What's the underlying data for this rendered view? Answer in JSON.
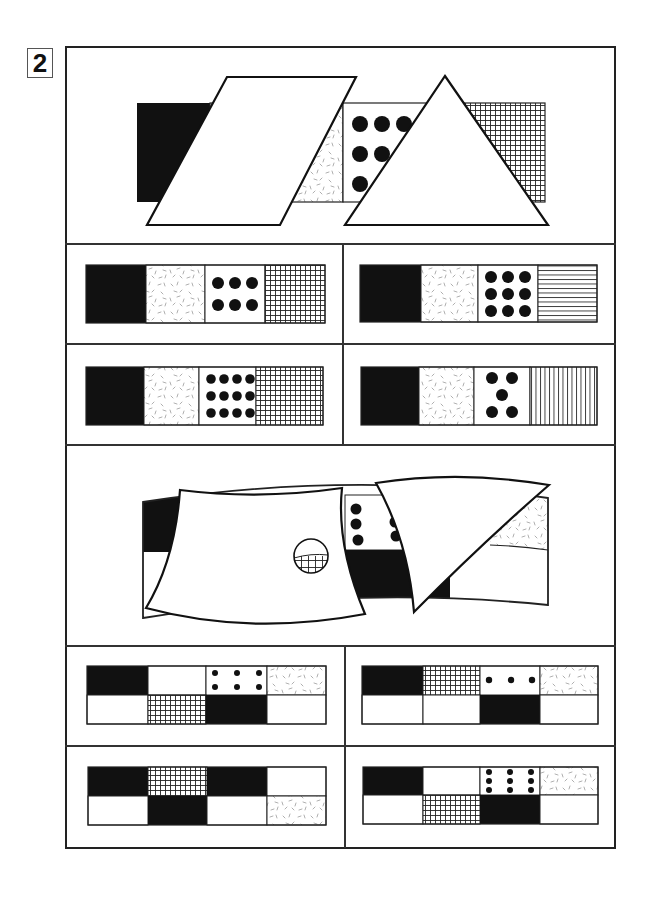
{
  "puzzle": {
    "number": "2",
    "colors": {
      "ink": "#111111",
      "line": "#222222",
      "paper": "#ffffff",
      "speckle": "#9a9a9a"
    },
    "problems": [
      {
        "id": "problem-1",
        "question": {
          "description": "Strip of four patterned squares (black, speckled, six large dots, fine grid) partly hidden behind a white parallelogram and a white triangle",
          "visible_segments": [
            "solid-black",
            "speckled",
            "large-dots-grid",
            "fine-grid"
          ],
          "occluders": [
            "parallelogram",
            "triangle"
          ]
        },
        "options": [
          {
            "position": "top-left",
            "cells": [
              "solid-black",
              "speckled",
              "dots-2x3 (6 large)",
              "fine-grid"
            ]
          },
          {
            "position": "top-right",
            "cells": [
              "solid-black",
              "speckled",
              "dots-3x3 (9 large)",
              "horizontal-lines"
            ]
          },
          {
            "position": "bottom-left",
            "cells": [
              "solid-black",
              "speckled",
              "dots-3x4 (12 large)",
              "fine-grid"
            ]
          },
          {
            "position": "bottom-right",
            "cells": [
              "solid-black",
              "speckled",
              "dots-five-dice (5 large)",
              "vertical-lines"
            ]
          }
        ]
      },
      {
        "id": "problem-2",
        "question": {
          "description": "Curved two-row band of patterned rectangles partly hidden behind a curved white panel (with a circular window showing grid) and a curved triangle",
          "visible_segments": [
            "solid-black",
            "white",
            "small-dots",
            "solid-black",
            "speckled",
            "grid-through-window"
          ],
          "occluders": [
            "curved-panel-with-window",
            "curved-triangle"
          ]
        },
        "options": [
          {
            "position": "top-left",
            "top_row": [
              "solid-black",
              "white",
              "dots-2x3 (6 small)",
              "speckled"
            ],
            "bottom_row": [
              "white",
              "fine-grid",
              "solid-black",
              "white"
            ]
          },
          {
            "position": "top-right",
            "top_row": [
              "solid-black",
              "fine-grid",
              "dots-1x3 (3 small)",
              "speckled"
            ],
            "bottom_row": [
              "white",
              "white",
              "solid-black",
              "white"
            ]
          },
          {
            "position": "bottom-left",
            "top_row": [
              "solid-black",
              "fine-grid",
              "solid-black",
              "white"
            ],
            "bottom_row": [
              "white",
              "solid-black",
              "white",
              "speckled"
            ]
          },
          {
            "position": "bottom-right",
            "top_row": [
              "solid-black",
              "white",
              "dots-3x3 (9 small)",
              "speckled"
            ],
            "bottom_row": [
              "white",
              "fine-grid",
              "solid-black",
              "white"
            ]
          }
        ]
      }
    ]
  }
}
